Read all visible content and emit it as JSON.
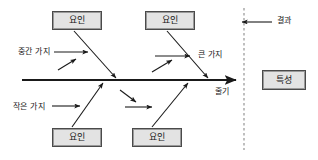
{
  "diagram": {
    "type": "fishbone-cause-and-effect",
    "title": "",
    "background_color": "#ffffff",
    "line_color": "#1a1a1a",
    "box_fill_color": "#e3e3e3",
    "box_border_color": "#4a4a4a",
    "dashed_divider_color": "#8a8a8a",
    "factor_boxes": [
      {
        "id": "factor-top-left",
        "label": "요인",
        "x": 52,
        "y": 11,
        "w": 50,
        "h": 19
      },
      {
        "id": "factor-top-right",
        "label": "요인",
        "x": 145,
        "y": 11,
        "w": 50,
        "h": 19
      },
      {
        "id": "factor-bottom-left",
        "label": "요인",
        "x": 52,
        "y": 128,
        "w": 50,
        "h": 19
      },
      {
        "id": "factor-bottom-right",
        "label": "요인",
        "x": 132,
        "y": 128,
        "w": 50,
        "h": 19
      }
    ],
    "outcome_box": {
      "id": "characteristic",
      "label": "특성",
      "x": 262,
      "y": 70,
      "w": 44,
      "h": 20
    },
    "labels": [
      {
        "id": "middle-branch-label",
        "label": "중간 가지",
        "x": 18,
        "y": 48
      },
      {
        "id": "big-branch-label",
        "label": "큰 가지",
        "x": 198,
        "y": 51
      },
      {
        "id": "small-branch-label",
        "label": "작은 가지",
        "x": 13,
        "y": 103
      },
      {
        "id": "stem-label",
        "label": "줄기",
        "x": 215,
        "y": 88
      },
      {
        "id": "result-label",
        "label": "결과",
        "x": 277,
        "y": 17
      }
    ],
    "spine": {
      "x1": 22,
      "y1": 80,
      "x2": 238,
      "y2": 80
    },
    "dashed_divider": {
      "x": 244,
      "y1": 8,
      "y2": 150
    },
    "result_arrow": {
      "x1": 270,
      "y1": 22,
      "x2": 240,
      "y2": 22
    }
  }
}
